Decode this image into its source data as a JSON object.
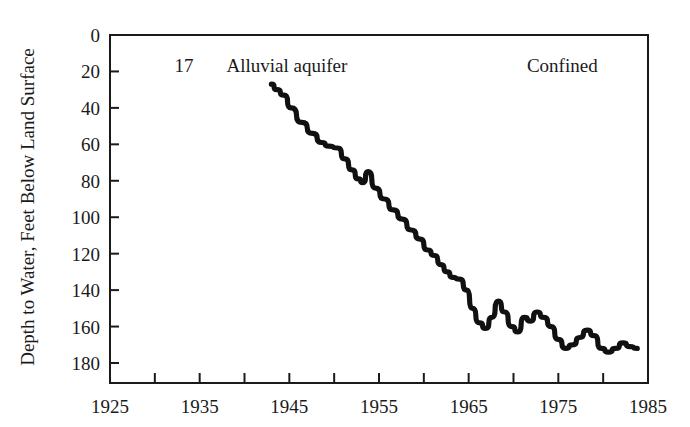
{
  "chart_data": {
    "type": "line",
    "title": "",
    "subtitle": "",
    "xlabel": "",
    "ylabel": "Depth to Water, Feet Below Land Surface",
    "xlim": [
      1925,
      1985
    ],
    "ylim": [
      0,
      190
    ],
    "y_inverted": true,
    "grid": false,
    "legend_position": "none",
    "x_ticks": [
      1925,
      1930,
      1935,
      1940,
      1945,
      1950,
      1955,
      1960,
      1965,
      1970,
      1975,
      1980,
      1985
    ],
    "x_tick_labels": [
      "1925",
      "",
      "1935",
      "",
      "1945",
      "",
      "1955",
      "",
      "1965",
      "",
      "1975",
      "",
      "1985"
    ],
    "y_ticks": [
      0,
      20,
      40,
      60,
      80,
      100,
      120,
      140,
      160,
      180
    ],
    "y_tick_labels": [
      "0",
      "20",
      "40",
      "60",
      "80",
      "100",
      "120",
      "140",
      "160",
      "180"
    ],
    "annotations": [
      {
        "name": "figure-number",
        "text": "17",
        "x": 1932.2,
        "y": 17
      },
      {
        "name": "aquifer-type",
        "text": "Alluvial aquifer",
        "x": 1938.0,
        "y": 17
      },
      {
        "name": "confined-label",
        "text": "Confined",
        "x": 1971.5,
        "y": 17
      }
    ],
    "series": [
      {
        "name": "Depth to water",
        "color": "#111111",
        "x": [
          1943.0,
          1943.6,
          1944.4,
          1945.2,
          1946.4,
          1947.6,
          1948.6,
          1949.4,
          1950.4,
          1951.2,
          1952.0,
          1952.7,
          1953.2,
          1953.8,
          1954.6,
          1955.6,
          1956.6,
          1957.6,
          1958.6,
          1959.6,
          1960.4,
          1961.2,
          1961.9,
          1962.6,
          1963.2,
          1964.0,
          1964.8,
          1965.4,
          1966.2,
          1966.9,
          1967.6,
          1968.3,
          1969.0,
          1969.8,
          1970.5,
          1971.2,
          1971.9,
          1972.6,
          1973.4,
          1974.2,
          1975.0,
          1975.8,
          1976.6,
          1977.4,
          1978.2,
          1979.0,
          1979.8,
          1980.6,
          1981.4,
          1982.2,
          1983.0,
          1983.8
        ],
        "y": [
          27,
          30,
          33,
          40,
          48,
          54,
          59,
          61,
          62,
          68,
          74,
          79,
          81,
          75,
          84,
          90,
          96,
          101,
          107,
          112,
          118,
          121,
          126,
          130,
          133,
          134,
          140,
          150,
          158,
          161,
          155,
          146,
          152,
          160,
          163,
          155,
          157,
          152,
          155,
          160,
          167,
          172,
          170,
          166,
          162,
          165,
          172,
          174,
          172,
          169,
          171,
          172
        ]
      }
    ]
  },
  "axes": {
    "y_axis_title": "Depth to Water, Feet Below Land Surface"
  }
}
